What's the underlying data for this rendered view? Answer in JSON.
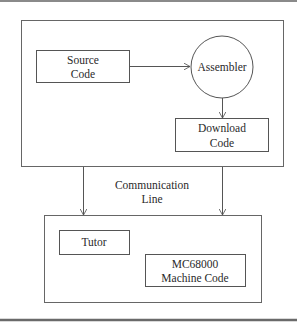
{
  "diagram": {
    "nodes": {
      "source_code": {
        "line1": "Source",
        "line2": "Code",
        "shape": "rectangle"
      },
      "assembler": {
        "label": "Assembler",
        "shape": "circle"
      },
      "download_code": {
        "line1": "Download",
        "line2": "Code",
        "shape": "rectangle"
      },
      "tutor": {
        "label": "Tutor",
        "shape": "rectangle"
      },
      "machine_code": {
        "line1": "MC68000",
        "line2": "Machine Code",
        "shape": "rectangle"
      }
    },
    "groups": {
      "host_system": {
        "contains": [
          "source_code",
          "assembler",
          "download_code"
        ]
      },
      "target_system": {
        "contains": [
          "tutor",
          "machine_code"
        ]
      }
    },
    "connector_label": {
      "line1": "Communication",
      "line2": "Line"
    },
    "edges": [
      {
        "from": "source_code",
        "to": "assembler"
      },
      {
        "from": "assembler",
        "to": "download_code"
      },
      {
        "from": "host_system",
        "to": "target_system",
        "label": "Communication Line"
      },
      {
        "from": "host_system",
        "to": "target_system"
      }
    ],
    "colors": {
      "stroke": "#555555",
      "text": "#2a2a2a",
      "rule": "#8a8a8a",
      "background": "#ffffff"
    }
  }
}
